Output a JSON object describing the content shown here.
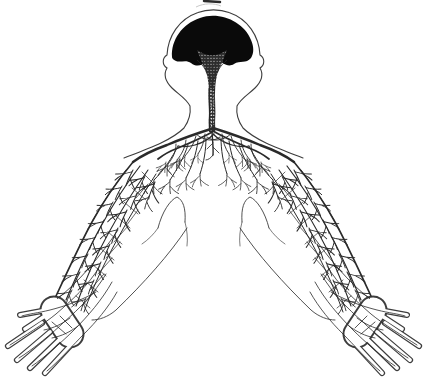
{
  "figure": {
    "background": "#ffffff",
    "ink": "#1f1f1f",
    "nerve_ink": "#2a2a2a",
    "outline_ink": "#3d3d3d",
    "brain_fill": "#0a0a0a",
    "stipple_base": "#2e2e2e",
    "stipple_dot": "#f5f5f5",
    "artifact_ink": "#2b2b2b",
    "artifact_faint": "#c9c9c9"
  }
}
